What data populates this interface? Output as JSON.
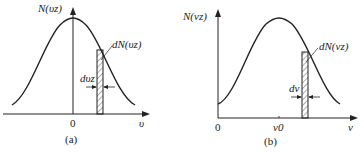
{
  "panel_a": {
    "y_label": "N(υz)",
    "strip_label": "dN(υz)",
    "width_label": "dυz",
    "origin_label": "0",
    "x_label": "υ",
    "caption": "(a)"
  },
  "panel_b": {
    "y_label": "N(νz)",
    "strip_label": "dN(νz)",
    "width_label": "dν",
    "origin_label": "0",
    "center_label": "ν0",
    "x_label": "ν",
    "caption": "(b)"
  }
}
